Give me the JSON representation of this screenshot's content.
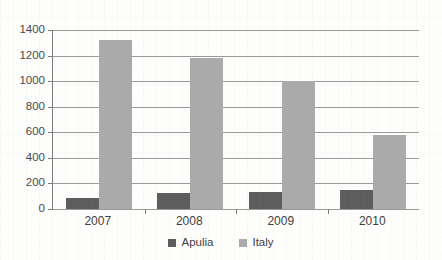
{
  "chart_data": {
    "type": "bar",
    "title": "",
    "subtitle": "",
    "xlabel": "",
    "ylabel": "",
    "categories": [
      "2007",
      "2008",
      "2009",
      "2010"
    ],
    "series": [
      {
        "name": "Apulia",
        "color": "#5d5d5d",
        "values": [
          85,
          125,
          130,
          148
        ]
      },
      {
        "name": "Italy",
        "color": "#aaaaaa",
        "values": [
          1320,
          1180,
          1005,
          578
        ]
      }
    ],
    "ylim": [
      0,
      1400
    ],
    "ytick_values": [
      0,
      200,
      400,
      600,
      800,
      1000,
      1200,
      1400
    ],
    "ytick_labels": [
      "0",
      "200",
      "400",
      "600",
      "800",
      "1000",
      "1200",
      "1400"
    ],
    "grid": true,
    "grid_axis": "y",
    "legend": true,
    "legend_position": "bottom-center",
    "legend_entries": [
      "Apulia",
      "Italy"
    ],
    "annotations": []
  },
  "colors": {
    "apulia": "#5d5d5d",
    "italy": "#aaaaaa",
    "gridline": "#9a9a9a",
    "axis": "#7b7b7b",
    "background": "#fdfdfc",
    "text": "#3f3f3f"
  }
}
